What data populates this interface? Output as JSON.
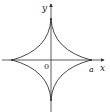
{
  "figure": {
    "type": "astroid",
    "equation_hint": "x^(2/3) + y^(2/3) = a^(2/3)",
    "labels": {
      "x_axis": "x",
      "y_axis": "y",
      "origin": "0",
      "intercept": "a"
    },
    "colors": {
      "stroke": "#333333",
      "background": "#ffffff"
    }
  }
}
